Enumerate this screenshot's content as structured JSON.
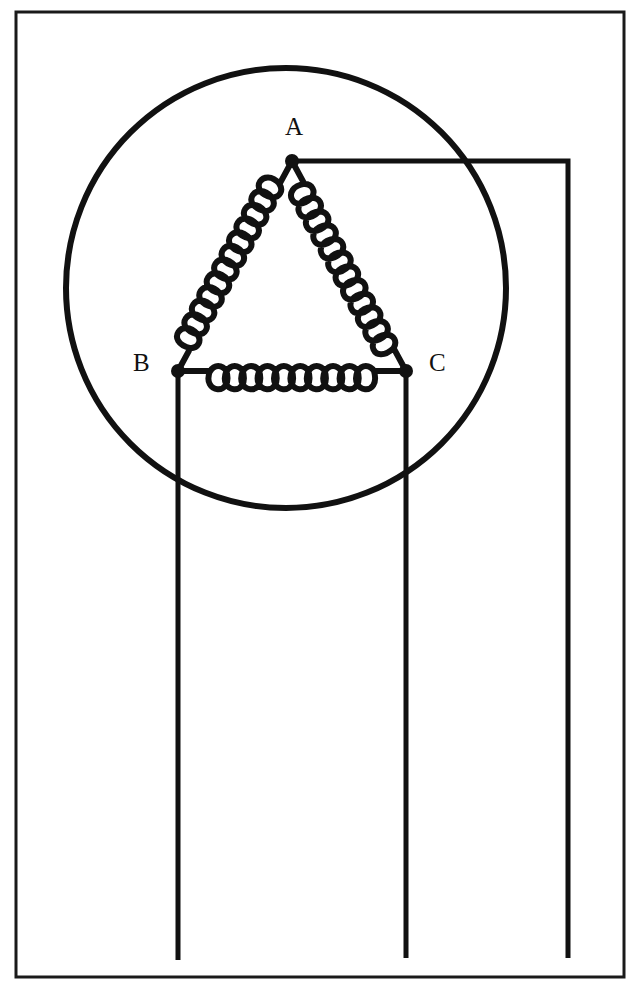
{
  "figure": {
    "background_color": "#ffffff",
    "ink_color": "#111111",
    "width": 640,
    "height": 995
  },
  "border": {
    "name": "outer-frame",
    "x": 16,
    "y": 12,
    "width": 608,
    "height": 965,
    "stroke_width": 3,
    "color": "#1a1a1a"
  },
  "stator_circle": {
    "name": "stator-circle",
    "center_x": 286,
    "center_y": 288,
    "radius": 220,
    "stroke_width": 6,
    "color": "#111111"
  },
  "nodes": [
    {
      "id": "A",
      "label": "A",
      "x": 292,
      "y": 161,
      "label_x": 285,
      "label_y": 114,
      "dot_radius": 7
    },
    {
      "id": "B",
      "label": "B",
      "x": 178,
      "y": 371,
      "label_x": 133,
      "label_y": 350,
      "dot_radius": 7
    },
    {
      "id": "C",
      "label": "C",
      "x": 406,
      "y": 371,
      "label_x": 429,
      "label_y": 350,
      "dot_radius": 7
    }
  ],
  "windings": [
    {
      "name": "winding-AB",
      "from": "A",
      "to": "B",
      "turns": 12,
      "coil_radius": 15,
      "lead_length": 26,
      "stroke_width": 6
    },
    {
      "name": "winding-AC",
      "from": "A",
      "to": "C",
      "turns": 12,
      "coil_radius": 15,
      "lead_length": 26,
      "stroke_width": 6
    },
    {
      "name": "winding-BC",
      "from": "B",
      "to": "C",
      "turns": 10,
      "coil_radius": 15,
      "lead_length": 32,
      "stroke_width": 6
    }
  ],
  "leads": [
    {
      "name": "lead-from-A",
      "from_node": "A",
      "points": [
        [
          292,
          161
        ],
        [
          568,
          161
        ],
        [
          568,
          958
        ]
      ],
      "stroke_width": 5
    },
    {
      "name": "lead-from-B",
      "from_node": "B",
      "points": [
        [
          178,
          371
        ],
        [
          178,
          960
        ]
      ],
      "stroke_width": 5
    },
    {
      "name": "lead-from-C",
      "from_node": "C",
      "points": [
        [
          406,
          371
        ],
        [
          406,
          958
        ]
      ],
      "stroke_width": 5
    }
  ]
}
